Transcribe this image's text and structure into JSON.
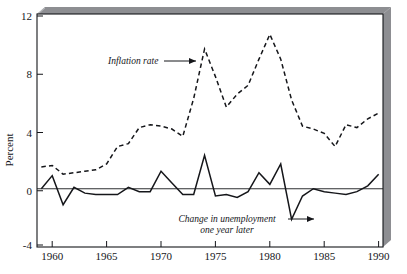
{
  "chart_data": {
    "type": "line",
    "title": "",
    "subtitle": "",
    "xlabel": "",
    "ylabel": "Percent",
    "xlim": [
      1958.6,
      1990.4
    ],
    "ylim": [
      -4,
      12
    ],
    "xticks": [
      1960,
      1965,
      1970,
      1975,
      1980,
      1985,
      1990
    ],
    "xtick_labels": [
      "1960",
      "1965",
      "1970",
      "1975",
      "1980",
      "1985",
      "1990"
    ],
    "yticks": [
      -4,
      0,
      4,
      8,
      12
    ],
    "ytick_labels": [
      "-4",
      "0",
      "4",
      "8",
      "12"
    ],
    "grid": false,
    "legend_position": "inline-annotations",
    "zero_line": 0,
    "x": [
      1959,
      1960,
      1961,
      1962,
      1963,
      1964,
      1965,
      1966,
      1967,
      1968,
      1969,
      1970,
      1971,
      1972,
      1973,
      1974,
      1975,
      1976,
      1977,
      1978,
      1979,
      1980,
      1981,
      1982,
      1983,
      1984,
      1985,
      1986,
      1987,
      1988,
      1989,
      1990
    ],
    "series": [
      {
        "name": "Inflation rate",
        "style": "dashed",
        "color": "#15161a",
        "values": [
          1.5,
          1.6,
          1.0,
          1.1,
          1.2,
          1.3,
          1.7,
          2.9,
          3.1,
          4.2,
          4.4,
          4.3,
          4.1,
          3.6,
          6.2,
          9.6,
          7.7,
          5.6,
          6.5,
          7.1,
          8.9,
          10.6,
          8.9,
          6.1,
          4.3,
          4.1,
          3.8,
          2.9,
          4.4,
          4.2,
          4.8,
          5.2
        ]
      },
      {
        "name": "Change in unemployment one year later",
        "style": "solid",
        "color": "#15161a",
        "values": [
          0.0,
          0.9,
          -1.1,
          0.1,
          -0.3,
          -0.4,
          -0.4,
          -0.4,
          0.1,
          -0.2,
          -0.2,
          1.2,
          0.4,
          -0.4,
          -0.4,
          2.3,
          -0.5,
          -0.4,
          -0.6,
          -0.2,
          1.1,
          0.3,
          1.7,
          -2.1,
          -0.5,
          0.0,
          -0.2,
          -0.3,
          -0.4,
          -0.2,
          0.2,
          1.0
        ]
      }
    ],
    "annotations": [
      {
        "name": "inflation-rate-annotation",
        "text_lines": [
          "Inflation rate"
        ],
        "arrow": "right"
      },
      {
        "name": "unemployment-change-annotation",
        "text_lines": [
          "Change in unemployment",
          "one year later"
        ],
        "arrow": "right"
      }
    ]
  },
  "style": {
    "frame_color": "#15161a",
    "shadow_color": "#8d8e92",
    "plot_background": "#ffffff",
    "line_color": "#15161a"
  }
}
